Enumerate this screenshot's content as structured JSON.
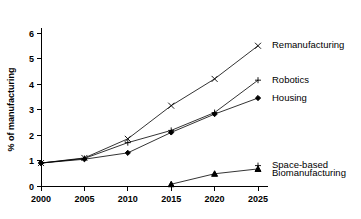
{
  "chart_data": {
    "type": "line",
    "title": "",
    "xlabel": "",
    "ylabel": "% of manufacturing",
    "x": [
      2000,
      2005,
      2010,
      2015,
      2020,
      2025
    ],
    "xtick_labels": [
      "2000",
      "2005",
      "2010",
      "2015",
      "2020",
      "2025"
    ],
    "ytick_labels": [
      "0",
      "1",
      "2",
      "3",
      "4",
      "5",
      "6"
    ],
    "xlim": [
      2000,
      2025
    ],
    "ylim": [
      0,
      6
    ],
    "grid": false,
    "legend_position": "right-inline",
    "series": [
      {
        "name": "Remanufacturing",
        "marker": "x",
        "x": [
          2000,
          2005,
          2010,
          2015,
          2020,
          2025
        ],
        "values": [
          0.9,
          1.1,
          1.85,
          3.15,
          4.2,
          5.5
        ]
      },
      {
        "name": "Robotics",
        "marker": "plus",
        "x": [
          2000,
          2005,
          2010,
          2015,
          2020,
          2025
        ],
        "values": [
          0.9,
          1.08,
          1.7,
          2.18,
          2.88,
          4.15
        ]
      },
      {
        "name": "Housing",
        "marker": "diamond",
        "x": [
          2000,
          2005,
          2010,
          2015,
          2020,
          2025
        ],
        "values": [
          0.9,
          1.05,
          1.3,
          2.1,
          2.82,
          3.45
        ]
      },
      {
        "name": "Space-based",
        "marker": "plus",
        "x": [
          2025
        ],
        "values": [
          0.8
        ]
      },
      {
        "name": "Biomanufacturing",
        "marker": "triangle",
        "x": [
          2015,
          2020,
          2025
        ],
        "values": [
          0.07,
          0.48,
          0.67
        ]
      }
    ],
    "annotations": [
      {
        "label": "Remanufacturing",
        "x": 2025,
        "y": 5.5
      },
      {
        "label": "Robotics",
        "x": 2025,
        "y": 4.15
      },
      {
        "label": "Housing",
        "x": 2025,
        "y": 3.45
      },
      {
        "label": "Space-based",
        "x": 2025,
        "y": 0.8
      },
      {
        "label": "Biomanufacturing",
        "x": 2025,
        "y": 0.5
      }
    ],
    "colors": {
      "line": "#000000",
      "marker": "#000000",
      "axis": "#000000"
    }
  }
}
